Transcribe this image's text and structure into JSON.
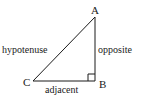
{
  "diagram": {
    "type": "right-triangle",
    "vertices": {
      "A": "A",
      "B": "B",
      "C": "C"
    },
    "sides": {
      "hypotenuse": "hypotenuse",
      "opposite": "opposite",
      "adjacent": "adjacent"
    },
    "right_angle_at": "B",
    "colors": {
      "line": "#1a1a1a",
      "text": "#1a1a1a",
      "background": "#ffffff"
    }
  }
}
